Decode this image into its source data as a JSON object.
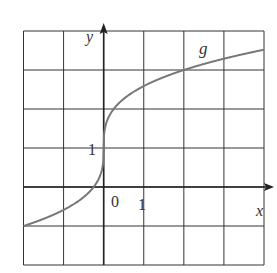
{
  "chart_data": {
    "type": "line",
    "title": "",
    "xlabel": "x",
    "ylabel": "y",
    "series": [
      {
        "name": "g",
        "function": "g(x) = 1 + cbrt(4x)",
        "x": [
          -2,
          -1,
          -0.5,
          0,
          0.5,
          1,
          2,
          3,
          4
        ],
        "values": [
          -1,
          -0.59,
          -0.26,
          1,
          2.26,
          2.59,
          3,
          3.29,
          3.52
        ]
      }
    ],
    "xlim": [
      -2,
      4
    ],
    "ylim": [
      -2,
      4
    ],
    "grid": true,
    "tick_labels": {
      "origin": "0",
      "x_one": "1",
      "y_one": "1"
    },
    "curve_label": "g",
    "colors": {
      "curve": "#777777",
      "grid": "#333333"
    }
  }
}
